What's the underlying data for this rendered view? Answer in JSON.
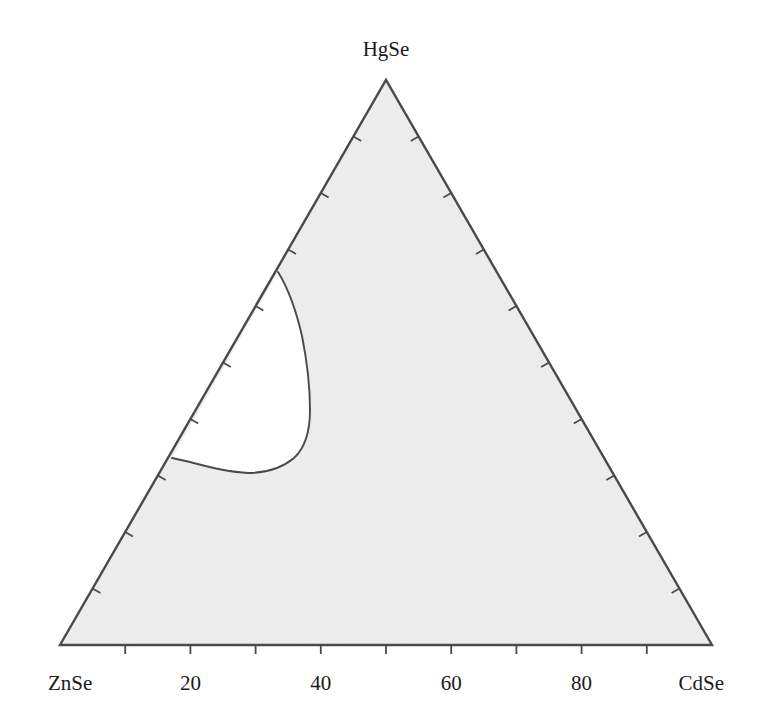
{
  "figure": {
    "type": "ternary-phase-diagram",
    "background_color": "#ffffff",
    "region_fill_color": "#ededed",
    "line_color": "#4a4a4a",
    "text_color": "#1a1a1a"
  },
  "vertices": {
    "top": {
      "label": "HgSe",
      "x": 386,
      "y": 80
    },
    "bottom_left": {
      "label": "ZnSe",
      "x": 60,
      "y": 645
    },
    "bottom_right": {
      "label": "CdSe",
      "x": 712,
      "y": 645
    }
  },
  "axis": {
    "bottom": {
      "tick_values": [
        10,
        20,
        30,
        40,
        50,
        60,
        70,
        80,
        90
      ],
      "labeled_ticks": [
        {
          "value": 20,
          "label": "20"
        },
        {
          "value": 40,
          "label": "40"
        },
        {
          "value": 60,
          "label": "60"
        },
        {
          "value": 80,
          "label": "80"
        }
      ]
    },
    "left": {
      "tick_values": [
        10,
        20,
        30,
        40,
        50,
        60,
        70,
        80,
        90
      ],
      "labeled_ticks": []
    },
    "right": {
      "tick_values": [
        10,
        20,
        30,
        40,
        50,
        60,
        70,
        80,
        90
      ],
      "labeled_ticks": []
    }
  },
  "chart_data": {
    "type": "line",
    "title": "",
    "subtitle": "",
    "xlabel": "",
    "ylabel": "",
    "grid": false,
    "legend": null,
    "diagram_kind": "ternary",
    "components": [
      "ZnSe",
      "CdSe",
      "HgSe"
    ],
    "axis_range": [
      0,
      100
    ],
    "tick_interval": 10,
    "labeled_tick_values": [
      20,
      40,
      60,
      80
    ],
    "regions": [
      {
        "name": "single-phase-solid-solution",
        "fill": "#ededed",
        "description": "shaded ternary field"
      },
      {
        "name": "miscibility-gap",
        "fill": "#ffffff",
        "description": "unshaded lobe adjoining the ZnSe-HgSe edge"
      }
    ],
    "series": [
      {
        "name": "miscibility-gap-boundary",
        "closed": true,
        "pixel_points": [
          [
            278,
            272
          ],
          [
            290,
            296
          ],
          [
            299,
            325
          ],
          [
            306,
            357
          ],
          [
            310,
            390
          ],
          [
            310,
            418
          ],
          [
            305,
            442
          ],
          [
            293,
            459
          ],
          [
            276,
            469
          ],
          [
            252,
            473
          ],
          [
            228,
            471
          ],
          [
            205,
            466
          ],
          [
            186,
            462
          ],
          [
            172,
            458
          ]
        ],
        "ternary_endpoints": [
          {
            "ZnSe": 33,
            "HgSe": 67,
            "CdSe": 0
          },
          {
            "ZnSe": 67,
            "HgSe": 33,
            "CdSe": 0
          }
        ]
      }
    ]
  }
}
